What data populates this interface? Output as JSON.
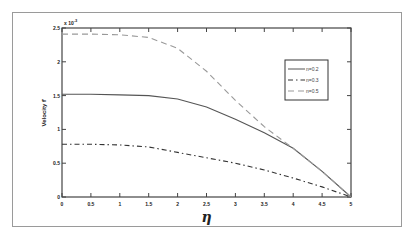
{
  "chart_data": {
    "type": "line",
    "title": "",
    "xlabel": "η",
    "ylabel": "Velocity f'",
    "y_multiplier": "x 10",
    "y_multiplier_exp": "-3",
    "xlim": [
      0,
      5
    ],
    "ylim": [
      0,
      2.5
    ],
    "grid": false,
    "legend_position": "upper right",
    "x_ticks": [
      "0",
      "0.5",
      "1",
      "1.5",
      "2",
      "2.5",
      "3",
      "3.5",
      "4",
      "4.5",
      "5"
    ],
    "y_ticks": [
      "0",
      "0.5",
      "1",
      "1.5",
      "2",
      "2.5"
    ],
    "x": [
      0,
      0.5,
      1,
      1.5,
      2,
      2.5,
      3,
      3.5,
      4,
      4.5,
      5
    ],
    "series": [
      {
        "name": "n=0.2",
        "style": "solid",
        "values": [
          1.52,
          1.52,
          1.51,
          1.5,
          1.45,
          1.33,
          1.15,
          0.95,
          0.72,
          0.38,
          0.0
        ]
      },
      {
        "name": "n=0.3",
        "style": "dashdot",
        "values": [
          0.78,
          0.78,
          0.77,
          0.74,
          0.66,
          0.58,
          0.5,
          0.4,
          0.28,
          0.15,
          0.0
        ]
      },
      {
        "name": "n=0.5",
        "style": "dashed",
        "values": [
          2.41,
          2.41,
          2.4,
          2.36,
          2.2,
          1.86,
          1.43,
          1.04,
          0.72,
          0.38,
          0.0
        ]
      }
    ]
  },
  "legend": {
    "entries": [
      "n=0.2",
      "n=0.3",
      "n=0.5"
    ]
  }
}
